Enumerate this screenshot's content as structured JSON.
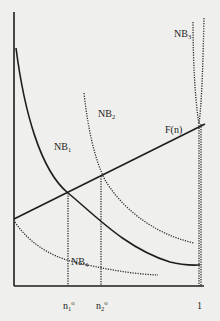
{
  "diagram": {
    "type": "economic-diagram",
    "axes": {
      "x_ticks": [
        {
          "label": "n",
          "sub": "1",
          "sup": "o"
        },
        {
          "label": "n",
          "sub": "2",
          "sup": "o"
        },
        {
          "label": "1",
          "sub": "",
          "sup": ""
        }
      ]
    },
    "curves": [
      {
        "name": "NB",
        "sub": "1",
        "style": "solid"
      },
      {
        "name": "NB",
        "sub": "2",
        "style": "dotted"
      },
      {
        "name": "NB",
        "sub": "3",
        "style": "dotted"
      },
      {
        "name": "NB",
        "sub": "4",
        "style": "dotted"
      },
      {
        "name": "F(n)",
        "sub": "",
        "style": "solid"
      }
    ]
  }
}
